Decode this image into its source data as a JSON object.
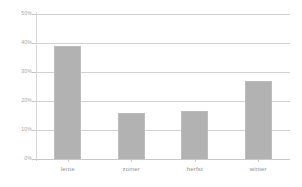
{
  "chart_data": {
    "type": "bar",
    "title": "",
    "subtitle": "",
    "xlabel": "",
    "ylabel": "",
    "categories": [
      "lente",
      "zomer",
      "herfst",
      "winter"
    ],
    "values": [
      39,
      16,
      16.5,
      27
    ],
    "value_labels": [
      "39%",
      "16%",
      "16.5%",
      "27%"
    ],
    "ylim": [
      0,
      50
    ],
    "ytick_values": [
      0,
      10,
      20,
      30,
      40,
      50
    ],
    "ytick_labels": [
      "0%",
      "10%",
      "20%",
      "30%",
      "40%",
      "50%"
    ],
    "grid": true,
    "legend": false,
    "legend_position": "none",
    "series": [
      {
        "name": "",
        "values": [
          39,
          16,
          16.5,
          27
        ]
      }
    ],
    "colors": {
      "bar_fill": "#b2b2b2",
      "bar_border": "#bdbdbd",
      "gridline": "#d2d2d2",
      "axis_line": "#c9c9c9",
      "tick_label": "#a8a8a8",
      "category_label": "#8f8f8f",
      "background": "#ffffff"
    }
  }
}
